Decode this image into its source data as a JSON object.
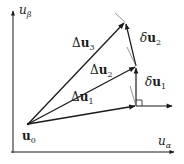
{
  "diagram": {
    "axes": {
      "x_label": "u",
      "x_sub": "α",
      "y_label": "u",
      "y_sub": "β"
    },
    "origin_label": {
      "base": "u",
      "sub": "0"
    },
    "vectors": [
      {
        "name": "Δu1",
        "prefix": "Δ",
        "base": "u",
        "sub": "1"
      },
      {
        "name": "Δu2",
        "prefix": "Δ",
        "base": "u",
        "sub": "2"
      },
      {
        "name": "Δu3",
        "prefix": "Δ",
        "base": "u",
        "sub": "3"
      }
    ],
    "increments": [
      {
        "name": "δu1",
        "prefix": "δ",
        "base": "u",
        "sub": "1"
      },
      {
        "name": "δu2",
        "prefix": "δ",
        "base": "u",
        "sub": "2"
      }
    ],
    "colors": {
      "stroke": "#1a1a1a",
      "thin": "#666666",
      "background": "#ffffff"
    }
  }
}
